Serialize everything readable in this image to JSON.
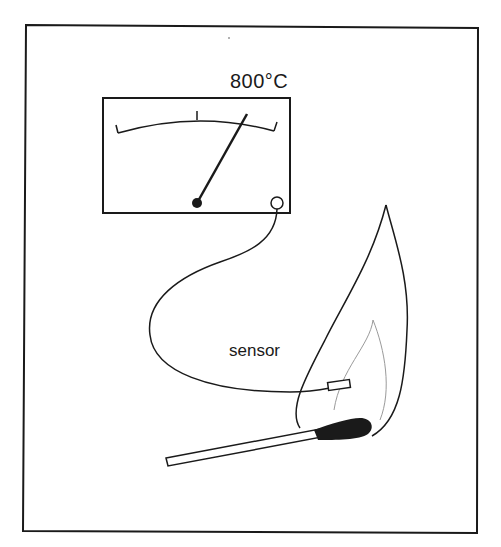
{
  "diagram": {
    "meter": {
      "reading": "800°C",
      "scale_ticks": 3
    },
    "labels": {
      "sensor": "sensor"
    },
    "components": [
      "frame",
      "meter",
      "needle",
      "wire",
      "sensor-probe",
      "flame",
      "match"
    ],
    "colors": {
      "ink": "#1a1a1a",
      "inner_flame": "#9a9a9a",
      "background": "#ffffff"
    }
  }
}
